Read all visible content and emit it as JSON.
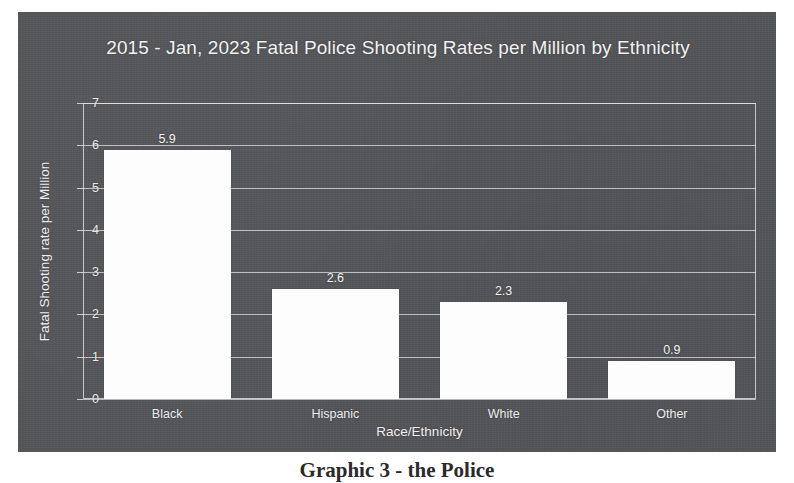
{
  "caption": "Graphic 3 - the Police",
  "chart_data": {
    "type": "bar",
    "title": "2015 - Jan, 2023 Fatal Police Shooting Rates per Million by Ethnicity",
    "xlabel": "Race/Ethnicity",
    "ylabel": "Fatal Shooting rate per Million",
    "categories": [
      "Black",
      "Hispanic",
      "White",
      "Other"
    ],
    "values": [
      5.9,
      2.6,
      2.3,
      0.9
    ],
    "value_labels": [
      "5.9",
      "2.6",
      "2.3",
      "0.9"
    ],
    "ylim": [
      0,
      7
    ],
    "yticks": [
      0,
      1,
      2,
      3,
      4,
      5,
      6,
      7
    ],
    "ytick_labels": [
      "0",
      "1",
      "2",
      "3",
      "4",
      "5",
      "6",
      "7"
    ],
    "grid": true,
    "legend": false,
    "bar_color": "#fdfdfd",
    "background_color": "#55565a",
    "text_color": "#f2f2f2",
    "gridline_color": "#e8e8e8"
  }
}
